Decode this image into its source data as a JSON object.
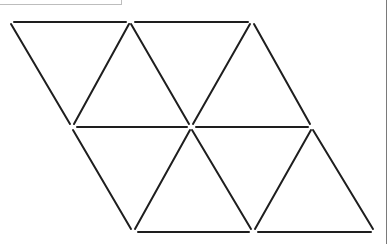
{
  "diagram": {
    "type": "triangle-net",
    "rows": 2,
    "triangles_per_row": 4,
    "stroke_color": "#1e1e1e",
    "vertices": {
      "top": [
        [
          10,
          22
        ],
        [
          130,
          22
        ],
        [
          252,
          22
        ]
      ],
      "middle": [
        [
          72,
          127
        ],
        [
          191,
          127
        ],
        [
          312,
          127
        ]
      ],
      "bottom": [
        [
          133,
          232
        ],
        [
          253,
          232
        ],
        [
          375,
          232
        ]
      ]
    },
    "edges": [
      [
        [
          14,
          22
        ],
        [
          126,
          22
        ]
      ],
      [
        [
          135,
          22
        ],
        [
          248,
          22
        ]
      ],
      [
        [
          77,
          127
        ],
        [
          187,
          127
        ]
      ],
      [
        [
          196,
          127
        ],
        [
          308,
          127
        ]
      ],
      [
        [
          138,
          232
        ],
        [
          249,
          232
        ]
      ],
      [
        [
          258,
          232
        ],
        [
          371,
          232
        ]
      ],
      [
        [
          11,
          24
        ],
        [
          70,
          124
        ]
      ],
      [
        [
          129,
          24
        ],
        [
          74,
          124
        ]
      ],
      [
        [
          131,
          24
        ],
        [
          189,
          124
        ]
      ],
      [
        [
          250,
          24
        ],
        [
          193,
          124
        ]
      ],
      [
        [
          254,
          24
        ],
        [
          310,
          124
        ]
      ],
      [
        [
          73,
          130
        ],
        [
          131,
          229
        ]
      ],
      [
        [
          190,
          130
        ],
        [
          135,
          229
        ]
      ],
      [
        [
          192,
          130
        ],
        [
          251,
          229
        ]
      ],
      [
        [
          311,
          130
        ],
        [
          255,
          229
        ]
      ],
      [
        [
          313,
          130
        ],
        [
          373,
          229
        ]
      ]
    ]
  },
  "frame": {
    "top_left_box": true,
    "right_rule": true
  }
}
